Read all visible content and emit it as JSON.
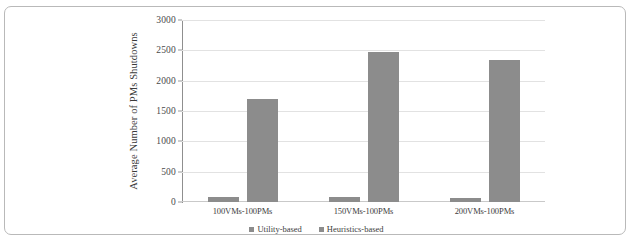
{
  "chart_data": {
    "type": "bar",
    "title": "",
    "xlabel": "",
    "ylabel": "Average Number of PMs Shutdowns",
    "ylim": [
      0,
      3000
    ],
    "ytick_labels": [
      "0",
      "500",
      "1000",
      "1500",
      "2000",
      "2500",
      "3000"
    ],
    "ytick_values": [
      0,
      500,
      1000,
      1500,
      2000,
      2500,
      3000
    ],
    "grid": true,
    "legend_position": "bottom-center",
    "categories": [
      "100VMs-100PMs",
      "150VMs-100PMs",
      "200VMs-100PMs"
    ],
    "series": [
      {
        "name": "Utility-based",
        "color": "#8c8c8c",
        "values": [
          80,
          75,
          70
        ]
      },
      {
        "name": "Heuristics-based",
        "color": "#8c8c8c",
        "values": [
          1700,
          2470,
          2340
        ]
      }
    ]
  },
  "legend": {
    "items": [
      {
        "label": "Utility-based"
      },
      {
        "label": "Heuristics-based"
      }
    ]
  }
}
